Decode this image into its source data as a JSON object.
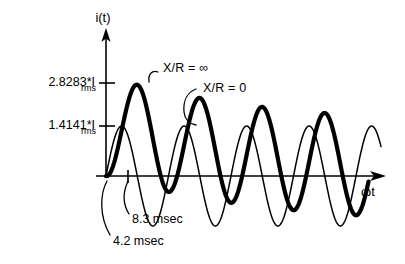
{
  "figure": {
    "y_axis_label": "i(t)",
    "x_axis_label": "ωt",
    "y_ticks": [
      {
        "value": 2.8283,
        "main": "2.8283*I",
        "sub": "rms"
      },
      {
        "value": 1.4141,
        "main": "1.4141*I",
        "sub": "rms"
      }
    ],
    "annotations": [
      {
        "id": "asym",
        "text": "X/R  =  ∞"
      },
      {
        "id": "sym",
        "text": "X/R  =  0"
      },
      {
        "id": "t83",
        "text": "8.3  msec"
      },
      {
        "id": "t42",
        "text": "4.2  msec"
      }
    ]
  },
  "chart_data": {
    "type": "line",
    "title": "",
    "xlabel": "ωt",
    "ylabel": "i(t)",
    "grid": false,
    "legend": "inline-annotations",
    "xlim": [
      0,
      9.2
    ],
    "ylim": [
      -3.0,
      3.0
    ],
    "ytick_values": [
      1.4141,
      2.8283
    ],
    "ytick_labels": [
      "1.4141*I_rms",
      "2.8283*I_rms"
    ],
    "xtick_values": [
      0.6981
    ],
    "xtick_labels": [
      "4.2 msec"
    ],
    "annotations": [
      {
        "text": "X/R = ∞",
        "points_to": "asymmetric-peak",
        "x": 1.75,
        "y": 2.83
      },
      {
        "text": "X/R = 0",
        "points_to": "symmetric-peak",
        "x": 3.0,
        "y": 1.41
      },
      {
        "text": "8.3 msec",
        "points_to": "half-cycle-tick",
        "x": 0.7,
        "y": 0
      },
      {
        "text": "4.2 msec",
        "points_to": "origin",
        "x": 0.0,
        "y": 0
      }
    ],
    "series": [
      {
        "name": "X/R = ∞",
        "style": "thick",
        "formula": "1.4141*(exp(-t/tau) - cos(wt)), tau large, peak 2.8283*I_rms",
        "peak_amplitude": 2.8283,
        "dc_offset_decay": "slow",
        "cycles": 4.2
      },
      {
        "name": "X/R = 0",
        "style": "thin",
        "formula": "1.4141*sin(wt)",
        "peak_amplitude": 1.4141,
        "dc_offset_decay": "none",
        "cycles": 4.4
      }
    ]
  }
}
